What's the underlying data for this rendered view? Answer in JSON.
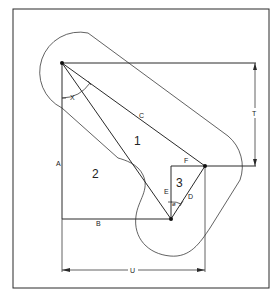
{
  "diagram": {
    "type": "geometric linkage / clearance diagram",
    "labels": {
      "x": "X",
      "c": "C",
      "t": "T",
      "a": "A",
      "b": "B",
      "e": "E",
      "f": "F",
      "d": "D",
      "u": "U",
      "phi": "ø",
      "region1": "1",
      "region2": "2",
      "region3": "3"
    },
    "points": {
      "pivot_top": [
        62,
        63
      ],
      "pivot_right": [
        205,
        166
      ],
      "pivot_bottom": [
        171,
        219
      ]
    },
    "colors": {
      "line": "#2a2a2a",
      "background": "#ffffff"
    }
  }
}
